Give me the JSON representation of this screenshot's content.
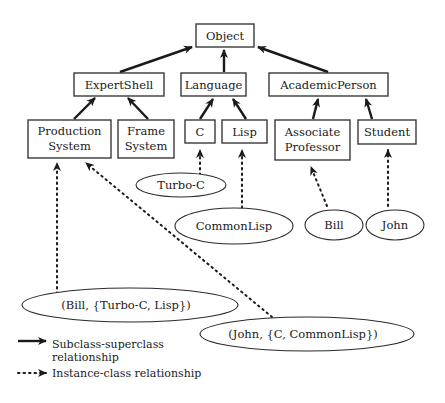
{
  "diagram": {
    "classes": {
      "object": "Object",
      "expert_shell": "ExpertShell",
      "language": "Language",
      "academic_person": "AcademicPerson",
      "production_system": [
        "Production",
        "System"
      ],
      "frame_system": [
        "Frame",
        "System"
      ],
      "c": "C",
      "lisp": "Lisp",
      "associate_professor": [
        "Associate",
        "Professor"
      ],
      "student": "Student"
    },
    "instances": {
      "turbo_c": "Turbo-C",
      "common_lisp": "CommonLisp",
      "bill": "Bill",
      "john": "John",
      "bill_tuple": "(Bill, {Turbo-C, Lisp})",
      "john_tuple": "(John, {C, CommonLisp})"
    },
    "subclass_edges": [
      [
        "ExpertShell",
        "Object"
      ],
      [
        "Language",
        "Object"
      ],
      [
        "AcademicPerson",
        "Object"
      ],
      [
        "Production System",
        "ExpertShell"
      ],
      [
        "Frame System",
        "ExpertShell"
      ],
      [
        "C",
        "Language"
      ],
      [
        "Lisp",
        "Language"
      ],
      [
        "Associate Professor",
        "AcademicPerson"
      ],
      [
        "Student",
        "AcademicPerson"
      ]
    ],
    "instance_edges": [
      [
        "Turbo-C",
        "C"
      ],
      [
        "CommonLisp",
        "Lisp"
      ],
      [
        "Bill",
        "Associate Professor"
      ],
      [
        "John",
        "Student"
      ],
      [
        "(Bill, {Turbo-C, Lisp})",
        "Production System"
      ],
      [
        "(John, {C, CommonLisp})",
        "Production System"
      ]
    ],
    "legend": {
      "subclass_line1": "Subclass-superclass",
      "subclass_line2": "relationship",
      "instance": "Instance-class relationship"
    }
  }
}
